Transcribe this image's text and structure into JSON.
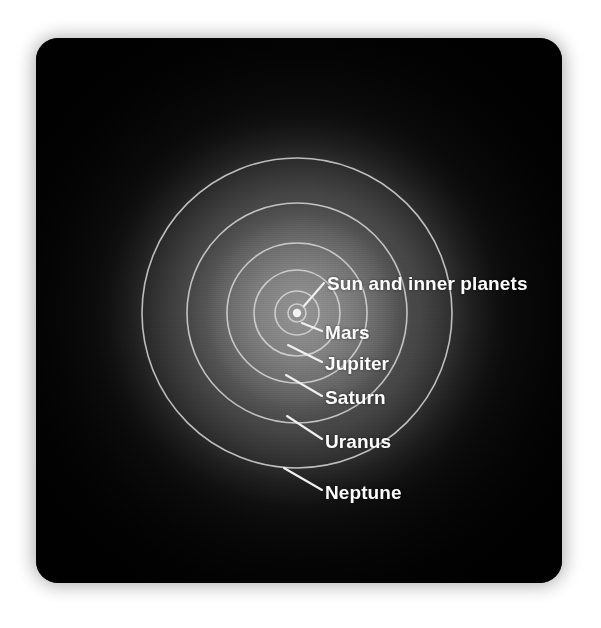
{
  "figure": {
    "background_color": "#ffffff",
    "panel_color": "#050505",
    "orbit_stroke_color": "#d8d8d8",
    "label_color": "#fdfdfd",
    "center": {
      "x": 261,
      "y": 275
    }
  },
  "chart_data": {
    "type": "scatter",
    "xlabel": "",
    "ylabel": "",
    "grid": false,
    "legend_position": "inline-callouts",
    "categories": [
      "Sun and inner planets",
      "Mars",
      "Jupiter",
      "Saturn",
      "Uranus",
      "Neptune"
    ],
    "values": [
      9,
      22,
      43,
      70,
      110,
      155
    ],
    "series": [
      {
        "name": "Orbit radius (pixels in figure)",
        "values": [
          9,
          22,
          43,
          70,
          110,
          155
        ]
      }
    ]
  },
  "orbits": [
    {
      "id": "sun-and-inner-planets",
      "label": "Sun and inner planets",
      "radius": 9,
      "label_x": 291,
      "label_y": 236,
      "leader": {
        "x1": 268,
        "y1": 268,
        "x2": 288,
        "y2": 245
      }
    },
    {
      "id": "mars",
      "label": "Mars",
      "radius": 22,
      "label_x": 289,
      "label_y": 285,
      "leader": {
        "x1": 266,
        "y1": 285,
        "x2": 286,
        "y2": 293
      }
    },
    {
      "id": "jupiter",
      "label": "Jupiter",
      "radius": 43,
      "label_x": 289,
      "label_y": 316,
      "leader": {
        "x1": 252,
        "y1": 307,
        "x2": 286,
        "y2": 324
      }
    },
    {
      "id": "saturn",
      "label": "Saturn",
      "radius": 70,
      "label_x": 289,
      "label_y": 350,
      "leader": {
        "x1": 250,
        "y1": 337,
        "x2": 286,
        "y2": 358
      }
    },
    {
      "id": "uranus",
      "label": "Uranus",
      "radius": 110,
      "label_x": 289,
      "label_y": 394,
      "leader": {
        "x1": 251,
        "y1": 378,
        "x2": 286,
        "y2": 401
      }
    },
    {
      "id": "neptune",
      "label": "Neptune",
      "radius": 155,
      "label_x": 289,
      "label_y": 445,
      "leader": {
        "x1": 248,
        "y1": 430,
        "x2": 286,
        "y2": 452
      }
    }
  ]
}
